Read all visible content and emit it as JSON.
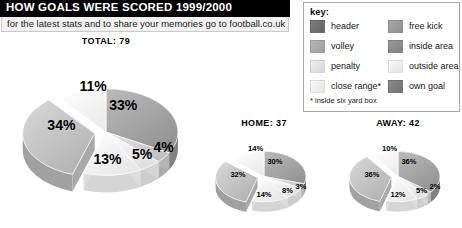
{
  "header": {
    "title": "HOW GOALS WERE SCORED 1999/2000",
    "subtitle": "for the latest stats and to share your memories go to football.co.uk"
  },
  "legend": {
    "title": "key:",
    "footnote": "* inside six yard box",
    "items": [
      {
        "label": "header",
        "color": "#6f6f6f",
        "column": "left",
        "row": 0
      },
      {
        "label": "volley",
        "color": "#a9a9a9",
        "column": "left",
        "row": 1
      },
      {
        "label": "penalty",
        "color": "#e2e2e2",
        "column": "left",
        "row": 2
      },
      {
        "label": "close range*",
        "color": "#eeeeee",
        "column": "left",
        "row": 3
      },
      {
        "label": "free kick",
        "color": "#9a9a9a",
        "column": "right",
        "row": 0
      },
      {
        "label": "inside area",
        "color": "#8c8c8c",
        "column": "right",
        "row": 1
      },
      {
        "label": "outside area",
        "color": "#ededed",
        "column": "right",
        "row": 2
      },
      {
        "label": "own goal",
        "color": "#7d7d7d",
        "column": "right",
        "row": 3
      }
    ]
  },
  "chart_data": [
    {
      "type": "pie",
      "title": "TOTAL: 79",
      "total": 79,
      "categories": [
        "header",
        "free kick",
        "volley",
        "penalty",
        "inside area",
        "own goal"
      ],
      "values": [
        33,
        4,
        5,
        13,
        34,
        11
      ],
      "labels": [
        "33%",
        "4%",
        "5%",
        "13%",
        "34%",
        "11%"
      ],
      "colors": [
        "#a4a4a4",
        "#cfcfcf",
        "#efefef",
        "#f7f7f7",
        "#c3c3c3",
        "#fbfbfb"
      ],
      "legend": "off",
      "grid": "off"
    },
    {
      "type": "pie",
      "title": "HOME: 37",
      "total": 37,
      "categories": [
        "header",
        "free kick",
        "volley",
        "penalty",
        "inside area",
        "own goal"
      ],
      "values": [
        30,
        3,
        8,
        14,
        32,
        14
      ],
      "labels": [
        "30%",
        "3%",
        "8%",
        "14%",
        "32%",
        "14%"
      ],
      "colors": [
        "#a4a4a4",
        "#cfcfcf",
        "#efefef",
        "#f7f7f7",
        "#c3c3c3",
        "#fbfbfb"
      ],
      "legend": "off",
      "grid": "off"
    },
    {
      "type": "pie",
      "title": "AWAY: 42",
      "total": 42,
      "categories": [
        "header",
        "free kick",
        "volley",
        "penalty",
        "inside area",
        "own goal"
      ],
      "values": [
        36,
        2,
        5,
        12,
        36,
        10
      ],
      "labels": [
        "36%",
        "2%",
        "5%",
        "12%",
        "36%",
        "10%"
      ],
      "colors": [
        "#a4a4a4",
        "#cfcfcf",
        "#efefef",
        "#f7f7f7",
        "#c3c3c3",
        "#fbfbfb"
      ],
      "legend": "off",
      "grid": "off"
    }
  ]
}
